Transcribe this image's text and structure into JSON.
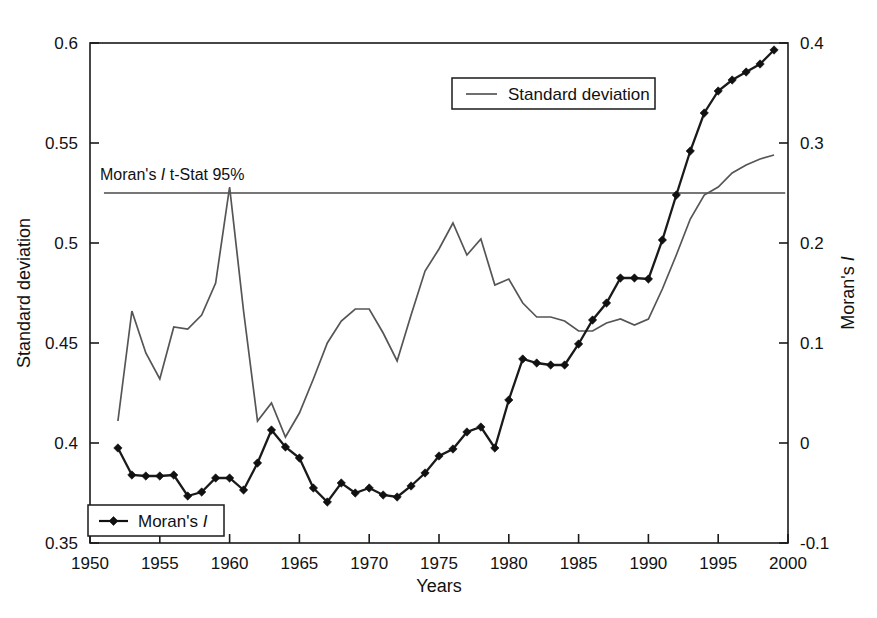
{
  "chart_data": {
    "type": "line",
    "title": "",
    "subtitle": "",
    "xlabel": "Years",
    "ylabel": "Standard deviation",
    "y2label": "Moran's I",
    "xlim": [
      1950,
      2000
    ],
    "ylim": [
      0.35,
      0.6
    ],
    "y2lim": [
      -0.1,
      0.4
    ],
    "grid": false,
    "legend_position": "top-center and bottom-left",
    "x_ticks": [
      "1950",
      "1955",
      "1960",
      "1965",
      "1970",
      "1975",
      "1980",
      "1985",
      "1990",
      "1995",
      "2000"
    ],
    "x_tick_values": [
      1950,
      1955,
      1960,
      1965,
      1970,
      1975,
      1980,
      1985,
      1990,
      1995,
      2000
    ],
    "y_ticks": [
      "0.35",
      "0.4",
      "0.45",
      "0.5",
      "0.55",
      "0.6"
    ],
    "y_tick_values": [
      0.35,
      0.4,
      0.45,
      0.5,
      0.55,
      0.6
    ],
    "y2_ticks": [
      "-0.1",
      "0",
      "0.1",
      "0.2",
      "0.3",
      "0.4"
    ],
    "y2_tick_values": [
      -0.1,
      0,
      0.1,
      0.2,
      0.3,
      0.4
    ],
    "annotations": [
      {
        "name": "t-stat-threshold",
        "text": "Moran's I   t-Stat 95%",
        "value": 0.25,
        "axis": "y2",
        "orientation": "horizontal",
        "x_start": 1951,
        "x_end": 1999.8
      }
    ],
    "series": [
      {
        "name": "Standard deviation",
        "axis": "y-left",
        "color": "#555555",
        "marker": "none",
        "x": [
          1952,
          1953,
          1954,
          1955,
          1956,
          1957,
          1958,
          1959,
          1960,
          1961,
          1962,
          1963,
          1964,
          1965,
          1966,
          1967,
          1968,
          1969,
          1970,
          1971,
          1972,
          1973,
          1974,
          1975,
          1976,
          1977,
          1978,
          1979,
          1980,
          1981,
          1982,
          1983,
          1984,
          1985,
          1986,
          1987,
          1988,
          1989,
          1990,
          1991,
          1992,
          1993,
          1994,
          1995,
          1996,
          1997,
          1998,
          1999
        ],
        "values": [
          0.411,
          0.466,
          0.445,
          0.432,
          0.458,
          0.457,
          0.464,
          0.48,
          0.528,
          0.466,
          0.411,
          0.42,
          0.403,
          0.415,
          0.432,
          0.45,
          0.461,
          0.467,
          0.467,
          0.455,
          0.441,
          0.464,
          0.486,
          0.497,
          0.51,
          0.494,
          0.502,
          0.479,
          0.482,
          0.47,
          0.463,
          0.463,
          0.461,
          0.456,
          0.456,
          0.46,
          0.462,
          0.459,
          0.462,
          0.477,
          0.494,
          0.512,
          0.524,
          0.528,
          0.535,
          0.539,
          0.542,
          0.544
        ]
      },
      {
        "name": "Moran's I",
        "axis": "y-right",
        "color": "#111111",
        "marker": "diamond",
        "x": [
          1952,
          1953,
          1954,
          1955,
          1956,
          1957,
          1958,
          1959,
          1960,
          1961,
          1962,
          1963,
          1964,
          1965,
          1966,
          1967,
          1968,
          1969,
          1970,
          1971,
          1972,
          1973,
          1974,
          1975,
          1976,
          1977,
          1978,
          1979,
          1980,
          1981,
          1982,
          1983,
          1984,
          1985,
          1986,
          1987,
          1988,
          1989,
          1990,
          1991,
          1992,
          1993,
          1994,
          1995,
          1996,
          1997,
          1998,
          1999
        ],
        "values": [
          -0.005,
          -0.032,
          -0.033,
          -0.033,
          -0.032,
          -0.053,
          -0.049,
          -0.035,
          -0.035,
          -0.047,
          -0.02,
          0.013,
          -0.004,
          -0.015,
          -0.045,
          -0.059,
          -0.04,
          -0.05,
          -0.045,
          -0.052,
          -0.054,
          -0.043,
          -0.03,
          -0.013,
          -0.006,
          0.011,
          0.016,
          -0.005,
          0.043,
          0.084,
          0.08,
          0.078,
          0.078,
          0.099,
          0.123,
          0.14,
          0.165,
          0.165,
          0.164,
          0.203,
          0.248,
          0.292,
          0.33,
          0.352,
          0.363,
          0.371,
          0.379,
          0.393
        ]
      }
    ]
  },
  "axes": {
    "left": {
      "title": "Standard deviation",
      "ticks": [
        "0.35",
        "0.4",
        "0.45",
        "0.5",
        "0.55",
        "0.6"
      ]
    },
    "right": {
      "title": "Moran's I",
      "title_prefix": "Moran's ",
      "title_italic": "I",
      "ticks": [
        "-0.1",
        "0",
        "0.1",
        "0.2",
        "0.3",
        "0.4"
      ]
    },
    "bottom": {
      "title": "Years",
      "ticks": [
        "1950",
        "1955",
        "1960",
        "1965",
        "1970",
        "1975",
        "1980",
        "1985",
        "1990",
        "1995",
        "2000"
      ]
    }
  },
  "legends": {
    "top": {
      "label": "Standard deviation",
      "swatch": "line-swatch"
    },
    "bottom": {
      "label_prefix": "Moran's ",
      "label_italic": "I",
      "label": "Moran's I",
      "swatch": "line-marker-swatch"
    }
  },
  "annotation_label": {
    "prefix": "Moran's ",
    "italic": "I",
    "suffix": "   t-Stat 95%",
    "full": "Moran's I   t-Stat 95%"
  },
  "colors": {
    "standard_deviation": "#555555",
    "moran": "#111111",
    "tstat_line": "#4a4a4a",
    "frame": "#1a1a1a",
    "background": "#ffffff"
  }
}
